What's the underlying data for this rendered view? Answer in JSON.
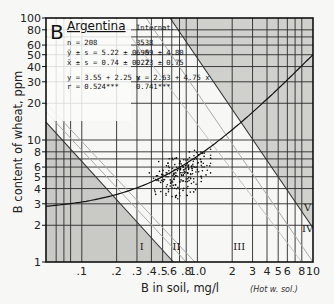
{
  "chart_data": {
    "type": "scatter",
    "panel_label": "B",
    "title": "Argentina",
    "xlabel": "B in soil, mg/l",
    "xlabel_note": "(Hot w. sol.)",
    "ylabel": "B content of wheat, ppm",
    "xscale": "log",
    "yscale": "log",
    "xlim": [
      0.049,
      10
    ],
    "ylim": [
      1,
      100
    ],
    "x_ticks": [
      {
        "v": 0.1,
        "label": ".1"
      },
      {
        "v": 0.2,
        "label": ".2"
      },
      {
        "v": 0.3,
        "label": ".3"
      },
      {
        "v": 0.4,
        "label": ".4"
      },
      {
        "v": 0.5,
        "label": ".5"
      },
      {
        "v": 0.6,
        "label": ".6"
      },
      {
        "v": 0.8,
        "label": ".8"
      },
      {
        "v": 1.0,
        "label": "1.0"
      },
      {
        "v": 2,
        "label": "2"
      },
      {
        "v": 3,
        "label": "3"
      },
      {
        "v": 4,
        "label": "4"
      },
      {
        "v": 5,
        "label": "5"
      },
      {
        "v": 6,
        "label": "6"
      },
      {
        "v": 8,
        "label": "8"
      },
      {
        "v": 10,
        "label": "10"
      }
    ],
    "y_ticks": [
      {
        "v": 1,
        "label": "1"
      },
      {
        "v": 2,
        "label": "2"
      },
      {
        "v": 3,
        "label": "3"
      },
      {
        "v": 4,
        "label": "4"
      },
      {
        "v": 5,
        "label": "5"
      },
      {
        "v": 6,
        "label": "6"
      },
      {
        "v": 8,
        "label": "8"
      },
      {
        "v": 10,
        "label": "10"
      },
      {
        "v": 20,
        "label": "20"
      },
      {
        "v": 30,
        "label": "30"
      },
      {
        "v": 40,
        "label": "40"
      },
      {
        "v": 50,
        "label": "50"
      },
      {
        "v": 60,
        "label": "60"
      },
      {
        "v": 80,
        "label": "80"
      },
      {
        "v": 100,
        "label": "100"
      }
    ],
    "grid_x": [
      0.06,
      0.07,
      0.08,
      0.1,
      0.2,
      0.3,
      0.4,
      0.5,
      0.6,
      0.7,
      0.8,
      1.0,
      2,
      3,
      4,
      5,
      6,
      7,
      8,
      10
    ],
    "grid_y": [
      2,
      3,
      4,
      5,
      6,
      7,
      8,
      10,
      20,
      30,
      40,
      50,
      60,
      70,
      80
    ],
    "stats_header": [
      "Argentina",
      "Internat."
    ],
    "stats": [
      {
        "label": "n = 208",
        "intl": "3538"
      },
      {
        "label": "ȳ ± s = 5.22 ± 0.95",
        "intl": "6.09 ± 4.80"
      },
      {
        "label": "x̄ ± s = 0.74 ± 0.22",
        "intl": "0.73 ± 0.75"
      },
      {
        "label": "y = 3.55 + 2.25 x",
        "intl": "y = 2.63 + 4.75 x"
      },
      {
        "label": "r = 0.524***",
        "intl": "0.741***"
      }
    ],
    "regression_curve": {
      "a": 2.63,
      "b": 4.75,
      "desc": "International regression y = 2.63 + 4.75x"
    },
    "zones": [
      {
        "id": "I",
        "label": "I",
        "x": 0.33,
        "y": 1.25
      },
      {
        "id": "II",
        "label": "II",
        "x": 0.66,
        "y": 1.25
      },
      {
        "id": "III",
        "label": "III",
        "x": 2.3,
        "y": 1.25
      },
      {
        "id": "IV",
        "label": "IV",
        "x": 9.0,
        "y": 1.75
      },
      {
        "id": "V",
        "label": "V",
        "x": 9.0,
        "y": 2.6
      }
    ],
    "scatter_summary": {
      "n": 208,
      "x_mean": 0.74,
      "y_mean": 5.22,
      "x_range": [
        0.35,
        1.3
      ],
      "y_range": [
        3.3,
        9.0
      ]
    }
  }
}
